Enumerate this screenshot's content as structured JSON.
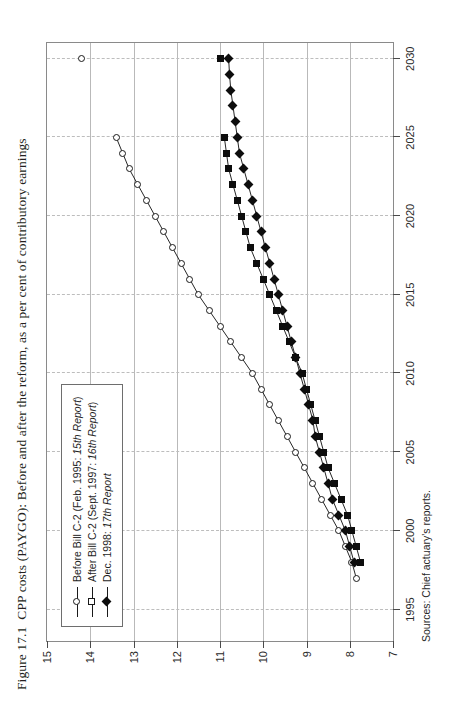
{
  "figure": {
    "number": "Figure 17.1",
    "caption": "CPP costs (PAYGO): Before and after the reform, as a per cent of contributory earnings",
    "source_note": "Sources: Chief actuary's reports."
  },
  "legend": {
    "items": [
      {
        "label": "Before Bill C-2 (Feb. 1995: ",
        "label_italic": "15th Report",
        "label_tail": ")",
        "marker": "open-circle-marker"
      },
      {
        "label": "After Bill C-2 (Sept. 1997: ",
        "label_italic": "16th Report",
        "label_tail": ")",
        "marker": "open-square-marker"
      },
      {
        "label": "Dec. 1998: ",
        "label_italic": "17th Report",
        "label_tail": "",
        "marker": "filled-diamond-marker"
      }
    ]
  },
  "colors": {
    "frame": "#8a8a8a",
    "gridline": "#b9b9b9",
    "gridline_dashed": "#bdbdbd",
    "series_ink": "#0d0d0d",
    "text": "#231f20"
  },
  "chart_data": {
    "type": "line",
    "xlabel": "",
    "ylabel": "",
    "xlim": [
      1993,
      2031
    ],
    "ylim": [
      7,
      15
    ],
    "xticks": [
      1995,
      2000,
      2005,
      2010,
      2015,
      2020,
      2025,
      2030
    ],
    "yticks": [
      7,
      8,
      9,
      10,
      11,
      12,
      13,
      14,
      15
    ],
    "grid": "horizontal solid at every 1 unit, vertical dashed at every 5 years",
    "legend_position": "top-left inside plot",
    "series": [
      {
        "name": "Before Bill C-2 (Feb. 1995: 15th Report)",
        "marker": "open-circle",
        "x": [
          1997,
          1998,
          1999,
          2000,
          2001,
          2002,
          2003,
          2004,
          2005,
          2006,
          2007,
          2008,
          2009,
          2010,
          2011,
          2012,
          2013,
          2014,
          2015,
          2016,
          2017,
          2018,
          2019,
          2020,
          2021,
          2022,
          2023,
          2024,
          2025,
          2030
        ],
        "y": [
          7.85,
          7.95,
          8.1,
          8.25,
          8.45,
          8.65,
          8.85,
          9.05,
          9.25,
          9.45,
          9.65,
          9.85,
          10.05,
          10.25,
          10.5,
          10.75,
          11.0,
          11.25,
          11.5,
          11.7,
          11.9,
          12.1,
          12.3,
          12.5,
          12.7,
          12.9,
          13.1,
          13.25,
          13.4,
          14.2
        ]
      },
      {
        "name": "After Bill C-2 (Sept. 1997: 16th Report)",
        "marker": "filled-square",
        "x": [
          1998,
          1999,
          2000,
          2001,
          2002,
          2003,
          2004,
          2005,
          2006,
          2007,
          2008,
          2009,
          2010,
          2011,
          2012,
          2013,
          2014,
          2015,
          2016,
          2017,
          2018,
          2019,
          2020,
          2021,
          2022,
          2023,
          2024,
          2025,
          2030
        ],
        "y": [
          7.75,
          7.85,
          7.95,
          8.05,
          8.2,
          8.35,
          8.5,
          8.6,
          8.7,
          8.8,
          8.9,
          9.0,
          9.1,
          9.25,
          9.4,
          9.55,
          9.7,
          9.85,
          10.0,
          10.15,
          10.3,
          10.4,
          10.5,
          10.6,
          10.7,
          10.8,
          10.85,
          10.9,
          11.0
        ]
      },
      {
        "name": "Dec. 1998: 17th Report",
        "marker": "filled-diamond",
        "x": [
          1998,
          1999,
          2000,
          2001,
          2002,
          2003,
          2004,
          2005,
          2006,
          2007,
          2008,
          2009,
          2010,
          2011,
          2012,
          2013,
          2014,
          2015,
          2016,
          2017,
          2018,
          2019,
          2020,
          2021,
          2022,
          2023,
          2024,
          2025,
          2026,
          2027,
          2028,
          2029,
          2030
        ],
        "y": [
          7.9,
          8.0,
          8.1,
          8.25,
          8.4,
          8.5,
          8.6,
          8.7,
          8.8,
          8.85,
          8.95,
          9.05,
          9.15,
          9.25,
          9.35,
          9.45,
          9.55,
          9.65,
          9.75,
          9.85,
          9.95,
          10.05,
          10.15,
          10.25,
          10.35,
          10.45,
          10.55,
          10.6,
          10.65,
          10.7,
          10.75,
          10.78,
          10.8
        ]
      }
    ]
  }
}
